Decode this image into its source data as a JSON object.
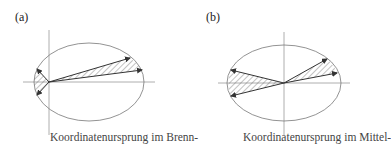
{
  "figure": {
    "panels": [
      {
        "label": "(a)",
        "caption": "Koordinatenursprung im Brenn-",
        "origin": "focus"
      },
      {
        "label": "(b)",
        "caption": "Koordinatenursprung im Mittel-",
        "origin": "center"
      }
    ],
    "colors": {
      "stroke": "#555555",
      "arrow": "#333333",
      "hatch": "#666666"
    }
  }
}
